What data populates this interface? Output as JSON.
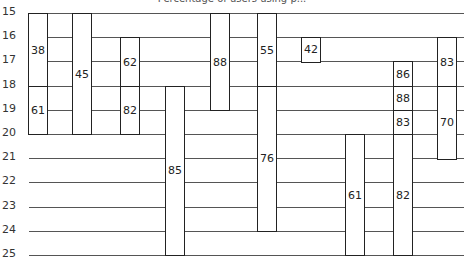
{
  "chart_data": {
    "type": "table",
    "title": "Percentage of users using p...",
    "xlabel": "",
    "ylabel": "",
    "y_ticks": [
      15,
      16,
      17,
      18,
      19,
      20,
      21,
      22,
      23,
      24,
      25
    ],
    "ylim": [
      15,
      25
    ],
    "grid": true,
    "columns": [
      {
        "index": 1,
        "segments": [
          {
            "start": 15,
            "end": 18,
            "value": "38"
          },
          {
            "start": 18,
            "end": 20,
            "value": "61"
          }
        ]
      },
      {
        "index": 2,
        "segments": [
          {
            "start": 15,
            "end": 20,
            "value": "45"
          }
        ]
      },
      {
        "index": 3,
        "segments": [
          {
            "start": 16,
            "end": 18,
            "value": "62"
          },
          {
            "start": 18,
            "end": 20,
            "value": "82"
          }
        ]
      },
      {
        "index": 4,
        "segments": [
          {
            "start": 18,
            "end": 25,
            "value": "85"
          }
        ]
      },
      {
        "index": 5,
        "segments": [
          {
            "start": 15,
            "end": 19,
            "value": "88"
          }
        ]
      },
      {
        "index": 6,
        "segments": [
          {
            "start": 15,
            "end": 18,
            "value": "55"
          },
          {
            "start": 18,
            "end": 24,
            "value": "76"
          }
        ]
      },
      {
        "index": 7,
        "segments": [
          {
            "start": 16,
            "end": 17,
            "value": "42"
          }
        ]
      },
      {
        "index": 8,
        "segments": [
          {
            "start": 20,
            "end": 25,
            "value": "61"
          }
        ]
      },
      {
        "index": 9,
        "segments": [
          {
            "start": 17,
            "end": 18,
            "value": "86"
          },
          {
            "start": 18,
            "end": 19,
            "value": "88"
          },
          {
            "start": 19,
            "end": 20,
            "value": "83"
          },
          {
            "start": 20,
            "end": 25,
            "value": "82"
          }
        ]
      },
      {
        "index": 10,
        "segments": [
          {
            "start": 16,
            "end": 18,
            "value": "83"
          },
          {
            "start": 18,
            "end": 21,
            "value": "70"
          }
        ]
      }
    ]
  },
  "layout": {
    "row_top_px": 13,
    "row_step_px": 24.2,
    "column_x_px": [
      28,
      72,
      120,
      165,
      210,
      257,
      301,
      345,
      393,
      437
    ],
    "column_width_px": 20
  }
}
